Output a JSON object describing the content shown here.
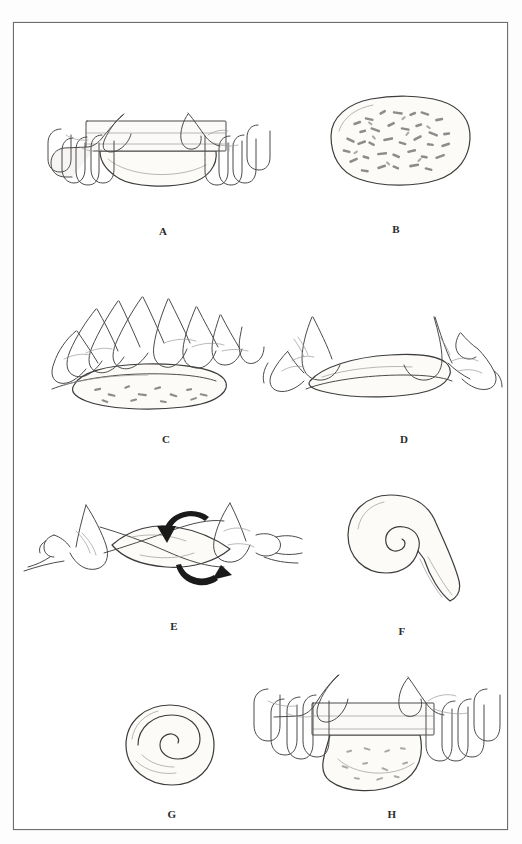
{
  "page": {
    "background_color": "#ffffff",
    "frame_color": "#6d6d6d",
    "ink_color": "#4a4a4a",
    "width": 522,
    "height": 844
  },
  "figure": {
    "kind": "instructional-line-drawing",
    "panel_count": 8
  },
  "panels": [
    {
      "id": "a",
      "label": "A",
      "caption": "A",
      "scene": "two hands rolling a pin over a flat rectangle of dough",
      "elements": [
        "left-hand",
        "right-hand",
        "rolling-pin",
        "flattened-dough"
      ]
    },
    {
      "id": "b",
      "label": "B",
      "caption": "B",
      "scene": "flattened oval of dough covered with scattered chopped filling",
      "elements": [
        "dough-oval",
        "filling-flecks"
      ]
    },
    {
      "id": "c",
      "label": "C",
      "caption": "C",
      "scene": "both hands pressing and rolling the filled dough into a log",
      "elements": [
        "left-hand",
        "right-hand",
        "rolling-dough-log",
        "filling-flecks"
      ]
    },
    {
      "id": "d",
      "label": "D",
      "caption": "D",
      "scene": "hands at each end elongating the rolled dough log",
      "elements": [
        "left-hand",
        "right-hand",
        "dough-log"
      ]
    },
    {
      "id": "e",
      "label": "E",
      "caption": "E",
      "scene": "hands twisting the dough rope in opposite directions, shown with two curved arrows",
      "elements": [
        "left-hand",
        "right-hand",
        "twisted-rope",
        "arrow-top-counterclockwise",
        "arrow-bottom-clockwise"
      ]
    },
    {
      "id": "f",
      "label": "F",
      "caption": "F",
      "scene": "twisted rope coiled into a spiral with a tail",
      "elements": [
        "coiled-spiral",
        "dough-tail"
      ]
    },
    {
      "id": "g",
      "label": "G",
      "caption": "G",
      "scene": "finished round bun with a visible spiral on top",
      "elements": [
        "round-bun",
        "spiral-mark"
      ]
    },
    {
      "id": "h",
      "label": "H",
      "caption": "H",
      "scene": "two hands rolling a pin to flatten the coiled bun",
      "elements": [
        "left-hand",
        "right-hand",
        "rolling-pin",
        "flattened-bun"
      ]
    }
  ]
}
